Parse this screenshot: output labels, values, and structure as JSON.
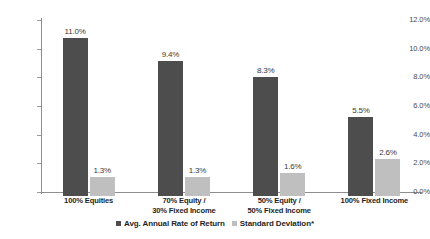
{
  "chart_data": {
    "type": "bar",
    "title": "",
    "subtitle": "",
    "xlabel": "",
    "ylabel": "",
    "ylim": [
      0,
      12
    ],
    "y_tick_labels": [
      "12.0%",
      "10.0%",
      "8.0%",
      "6.0%",
      "4.0%",
      "2.0%",
      "0.0%"
    ],
    "y_tick_values": [
      12,
      10,
      8,
      6,
      4,
      2,
      0
    ],
    "grid": false,
    "legend_position": "bottom",
    "categories": [
      "100% Equities",
      "70% Equity /\n30% Fixed Income",
      "50% Equity /\n50% Fixed Income",
      "100% Fixed Income"
    ],
    "series": [
      {
        "name": "Avg. Annual Rate of Return",
        "color": "#4d4d4d",
        "values": [
          11.0,
          9.4,
          8.3,
          5.5
        ],
        "labels": [
          "11.0%",
          "9.4%",
          "8.3%",
          "5.5%"
        ]
      },
      {
        "name": "Standard Deviation*",
        "color": "#bfbfbf",
        "values": [
          1.3,
          1.3,
          1.6,
          2.6
        ],
        "labels": [
          "1.3%",
          "1.3%",
          "1.6%",
          "2.6%"
        ]
      }
    ]
  },
  "legend": {
    "items": [
      {
        "label": "Avg. Annual Rate of Return",
        "swatch": "dark"
      },
      {
        "label": "Standard Deviation*",
        "swatch": "light"
      }
    ]
  },
  "colors": {
    "series_primary": "#4d4d4d",
    "series_secondary": "#bfbfbf",
    "axis": "#8e8e8e",
    "text": "#1f1f1f",
    "background": "#ffffff"
  }
}
